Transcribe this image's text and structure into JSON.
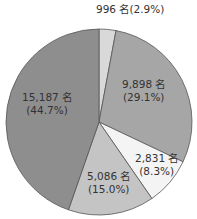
{
  "chart_data": {
    "type": "pie",
    "title": "",
    "unit": "名",
    "start_angle_deg": 0,
    "direction": "clockwise",
    "slices": [
      {
        "label": "996 名",
        "value": 996,
        "percent": "2.9%",
        "color": "#d9d9d9"
      },
      {
        "label": "9,898 名",
        "value": 9898,
        "percent": "29.1%",
        "color": "#a6a6a6"
      },
      {
        "label": "2,831 名",
        "value": 2831,
        "percent": "8.3%",
        "color": "#f4f4f4"
      },
      {
        "label": "5,086 名",
        "value": 5086,
        "percent": "15.0%",
        "color": "#c4c4c4"
      },
      {
        "label": "15,187 名",
        "value": 15187,
        "percent": "44.7%",
        "color": "#8e8e8e"
      }
    ]
  },
  "labels": {
    "s0": "996 名(2.9%)",
    "s1a": "9,898 名",
    "s1b": "(29.1%)",
    "s2a": "2,831 名",
    "s2b": "(8.3%)",
    "s3a": "5,086 名",
    "s3b": "(15.0%)",
    "s4a": "15,187 名",
    "s4b": "(44.7%)"
  }
}
